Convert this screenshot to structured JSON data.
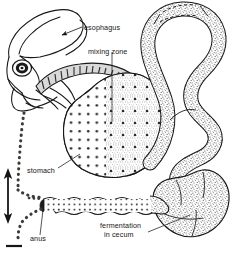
{
  "figure": {
    "type": "anatomical-diagram",
    "background_color": "#ffffff",
    "line_color": "#161616",
    "stipple_color": "#8a8a8a",
    "dot_color": "#2a2a2a"
  },
  "labels": {
    "esophagus": "esophagus",
    "mixing_zone": "mixing zone",
    "stomach": "stomach",
    "anus": "anus",
    "fermentation_line1": "fermentation",
    "fermentation_line2": "in cecum"
  },
  "structures": {
    "head": "rabbit-head-outline",
    "eye": "eye",
    "esophagus": "esophagus-tube",
    "stomach": "stomach-sac",
    "mixing_zone": "stomach-mixing-zone",
    "small_intestine": "coiled-small-intestine",
    "cecum": "fermentation-cecum",
    "colon": "colon-rectum",
    "anus": "anus-opening",
    "coprophagy_path": "dotted-reingestion-path",
    "arrow": "double-headed-vertical-arrow",
    "scale_bar": "scale-bar"
  }
}
